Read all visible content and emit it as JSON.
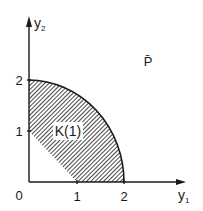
{
  "diagram": {
    "axes": {
      "x_label": "y",
      "x_label_sub": "1",
      "y_label": "y",
      "y_label_sub": "2",
      "origin_label": "0",
      "x_ticks": [
        "1",
        "2"
      ],
      "y_ticks": [
        "1",
        "2"
      ]
    },
    "region_label": "K(1)",
    "set_label": "P̄",
    "colors": {
      "ink": "#1a1a1a",
      "background": "#ffffff"
    }
  }
}
